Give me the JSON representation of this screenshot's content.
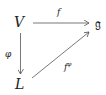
{
  "diagram": {
    "type": "commutative-diagram",
    "nodes": {
      "V": "V",
      "g": "𝔤",
      "L": "L"
    },
    "arrows": {
      "top": {
        "from": "V",
        "to": "𝔤",
        "label": "f"
      },
      "left": {
        "from": "V",
        "to": "L",
        "label": "φ"
      },
      "diagonal": {
        "from": "L",
        "to": "𝔤",
        "label_base": "f",
        "label_sup": "φ"
      }
    },
    "colors": {
      "stroke": "#555555",
      "text": "#222222"
    }
  }
}
